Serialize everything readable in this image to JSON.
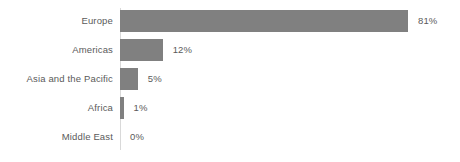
{
  "chart_data": {
    "type": "bar",
    "orientation": "horizontal",
    "title": "",
    "subtitle": "",
    "xlabel": "",
    "ylabel": "",
    "grid": false,
    "legend": null,
    "xlim": [
      0,
      100
    ],
    "value_suffix": "%",
    "categories": [
      "Europe",
      "Americas",
      "Asia and the Pacific",
      "Africa",
      "Middle East"
    ],
    "values": [
      81,
      12,
      5,
      1,
      0
    ],
    "value_labels": [
      "81%",
      "12%",
      "5%",
      "1%",
      "0%"
    ],
    "bars": [
      {
        "category": "Europe",
        "value": 81,
        "value_label": "81%"
      },
      {
        "category": "Americas",
        "value": 12,
        "value_label": "12%"
      },
      {
        "category": "Asia and the Pacific",
        "value": 5,
        "value_label": "5%"
      },
      {
        "category": "Africa",
        "value": 1,
        "value_label": "1%"
      },
      {
        "category": "Middle East",
        "value": 0,
        "value_label": "0%"
      }
    ],
    "colors": {
      "bar": "#808080",
      "label_text": "#5a5a5a",
      "axis_line": "#d9d9d9",
      "background": "#ffffff"
    }
  }
}
